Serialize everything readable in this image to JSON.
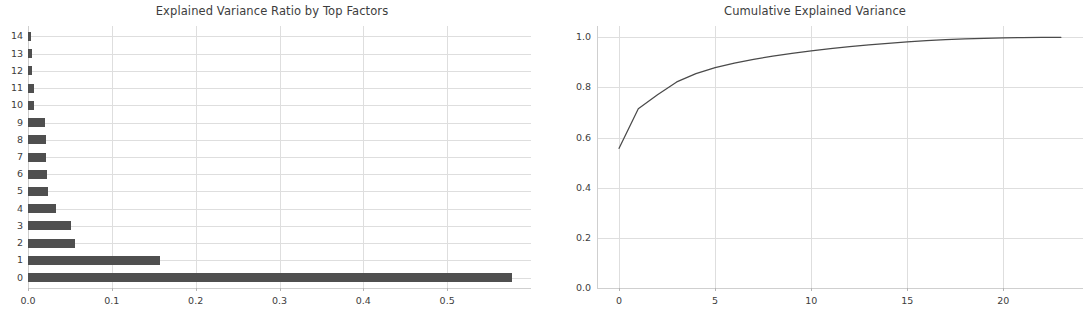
{
  "figure": {
    "width": 1087,
    "height": 312,
    "background": "#ffffff",
    "line_color": "#4a4a4a",
    "bar_color": "#4f4f4f",
    "grid_color": "#dedede",
    "axis_color": "#9a9a9a",
    "text_color": "#3d3d3d"
  },
  "chart_data": [
    {
      "type": "bar",
      "orientation": "horizontal",
      "title": "Explained Variance Ratio by Top Factors",
      "xlabel": "",
      "ylabel": "",
      "categories": [
        "0",
        "1",
        "2",
        "3",
        "4",
        "5",
        "6",
        "7",
        "8",
        "9",
        "10",
        "11",
        "12",
        "13",
        "14"
      ],
      "values": [
        0.577,
        0.158,
        0.056,
        0.051,
        0.033,
        0.024,
        0.023,
        0.021,
        0.021,
        0.02,
        0.007,
        0.007,
        0.005,
        0.005,
        0.004
      ],
      "xlim": [
        0.0,
        0.6
      ],
      "ylim": [
        -0.6,
        14.6
      ],
      "xticks": [
        0.0,
        0.1,
        0.2,
        0.3,
        0.4,
        0.5
      ],
      "xticklabels": [
        "0.0",
        "0.1",
        "0.2",
        "0.3",
        "0.4",
        "0.5"
      ],
      "yticks": [
        0,
        1,
        2,
        3,
        4,
        5,
        6,
        7,
        8,
        9,
        10,
        11,
        12,
        13,
        14
      ],
      "yticklabels": [
        "0",
        "1",
        "2",
        "3",
        "4",
        "5",
        "6",
        "7",
        "8",
        "9",
        "10",
        "11",
        "12",
        "13",
        "14"
      ],
      "grid": true,
      "grid_axis": "both",
      "legend": null
    },
    {
      "type": "line",
      "title": "Cumulative Explained Variance",
      "xlabel": "",
      "ylabel": "",
      "x": [
        0,
        1,
        2,
        3,
        4,
        5,
        6,
        7,
        8,
        9,
        10,
        11,
        12,
        13,
        14,
        15,
        16,
        17,
        18,
        19,
        20,
        21,
        22,
        23
      ],
      "y": [
        0.557,
        0.715,
        0.771,
        0.822,
        0.855,
        0.879,
        0.897,
        0.912,
        0.925,
        0.936,
        0.946,
        0.955,
        0.963,
        0.97,
        0.976,
        0.982,
        0.987,
        0.991,
        0.994,
        0.996,
        0.998,
        0.999,
        1.0,
        1.0
      ],
      "xlim": [
        -1.15,
        24.15
      ],
      "ylim": [
        0.0,
        1.045
      ],
      "xticks": [
        0,
        5,
        10,
        15,
        20
      ],
      "xticklabels": [
        "0",
        "5",
        "10",
        "15",
        "20"
      ],
      "yticks": [
        0.0,
        0.2,
        0.4,
        0.6,
        0.8,
        1.0
      ],
      "yticklabels": [
        "0.0",
        "0.2",
        "0.4",
        "0.6",
        "0.8",
        "1.0"
      ],
      "grid": true,
      "grid_axis": "both",
      "legend": null
    }
  ]
}
